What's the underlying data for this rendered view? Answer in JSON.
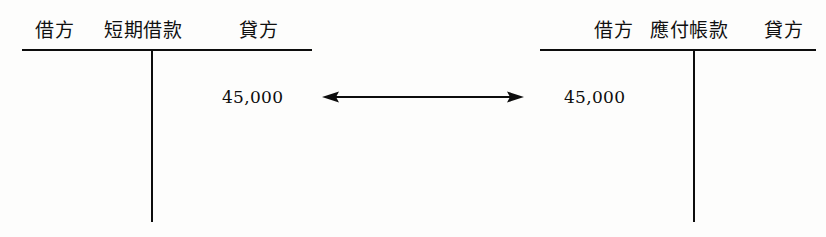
{
  "diagram": {
    "type": "t-account-pair",
    "background_color": "#fdfdfc",
    "ink_color": "#0d0d0d",
    "accounts": [
      {
        "id": "short-term-loans",
        "title": "短期借款",
        "debit_label": "借方",
        "credit_label": "貸方",
        "debit_amount": "",
        "credit_amount": "45,000"
      },
      {
        "id": "accounts-payable",
        "title": "應付帳款",
        "debit_label": "借方",
        "credit_label": "貸方",
        "debit_amount": "45,000",
        "credit_amount": ""
      }
    ],
    "connector": {
      "name": "double-headed-arrow",
      "direction": "bidirectional",
      "label": ""
    }
  }
}
